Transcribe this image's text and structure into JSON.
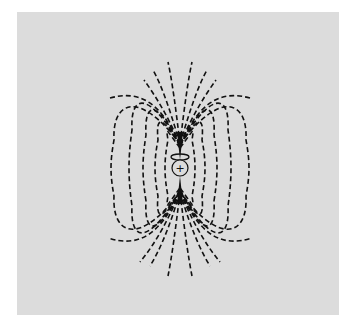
{
  "figure": {
    "background_color": "#dcdcdc",
    "line_color": "#111111",
    "line_style": "dashed",
    "charge_symbol": "+"
  },
  "elements": {
    "charge": {
      "label": "+",
      "cx": 180,
      "cy": 168,
      "r": 8
    },
    "loop": {
      "cx": 180,
      "cy": 157,
      "rx": 9,
      "ry": 3
    },
    "closed_loops": [
      {
        "half_width": 12,
        "top": 128,
        "bottom": 208
      },
      {
        "half_width": 22,
        "top": 115,
        "bottom": 221
      },
      {
        "half_width": 34,
        "top": 104,
        "bottom": 232
      },
      {
        "half_width": 48,
        "top": 98,
        "bottom": 238
      },
      {
        "half_width": 68,
        "top": 110,
        "bottom": 226
      }
    ],
    "fan_lines_top": [
      {
        "end_x": 170,
        "end_y": 62
      },
      {
        "end_x": 190,
        "end_y": 62
      },
      {
        "end_x": 155,
        "end_y": 70
      },
      {
        "end_x": 205,
        "end_y": 70
      },
      {
        "end_x": 140,
        "end_y": 78
      },
      {
        "end_x": 220,
        "end_y": 78
      }
    ],
    "fan_lines_bottom": [
      {
        "end_x": 168,
        "end_y": 274
      },
      {
        "end_x": 192,
        "end_y": 274
      },
      {
        "end_x": 152,
        "end_y": 266
      },
      {
        "end_x": 208,
        "end_y": 266
      },
      {
        "end_x": 140,
        "end_y": 262
      },
      {
        "end_x": 220,
        "end_y": 262
      }
    ]
  }
}
